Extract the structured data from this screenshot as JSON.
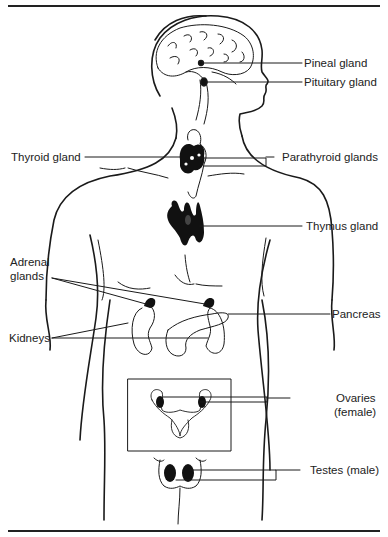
{
  "figure": {
    "colors": {
      "line": "#1a1a1a",
      "gland_fill": "#111111",
      "background": "#ffffff"
    },
    "labels": {
      "pineal": "Pineal gland",
      "pituitary": "Pituitary gland",
      "thyroid": "Thyroid gland",
      "parathyroid": "Parathyroid glands",
      "thymus": "Thymus gland",
      "adrenal_line1": "Adrenal",
      "adrenal_line2": "glands",
      "pancreas": "Pancreas",
      "kidneys": "Kidneys",
      "ovaries_line1": "Ovaries",
      "ovaries_line2": "(female)",
      "testes": "Testes (male)"
    }
  }
}
